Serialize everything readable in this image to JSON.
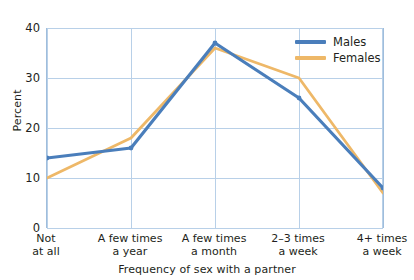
{
  "chart_data": {
    "type": "line",
    "title": "",
    "xlabel": "Frequency of sex with a partner",
    "ylabel": "Percent",
    "categories": [
      "Not\nat all",
      "A few times\na year",
      "A few times\na month",
      "2–3 times\na week",
      "4+ times\na week"
    ],
    "series": [
      {
        "name": "Males",
        "values": [
          14,
          16,
          37,
          26,
          8
        ],
        "color": "#4a7ebb"
      },
      {
        "name": "Females",
        "values": [
          10,
          18,
          36,
          30,
          7
        ],
        "color": "#eeb868"
      }
    ],
    "ylim": [
      0,
      40
    ],
    "yticks": [
      0,
      10,
      20,
      30,
      40
    ],
    "ytick_labels": [
      "0",
      "10",
      "20",
      "30",
      "40"
    ],
    "grid": "horizontal-and-vertical",
    "legend_position": "top-right-inside"
  },
  "axes": {
    "y_label": "Percent",
    "y_tick_labels": [
      "40",
      "30",
      "20",
      "10",
      "0"
    ],
    "x_tick_labels": [
      {
        "line1": "Not",
        "line2": "at all"
      },
      {
        "line1": "A few times",
        "line2": "a year"
      },
      {
        "line1": "A few times",
        "line2": "a month"
      },
      {
        "line1": "2–3 times",
        "line2": "a week"
      },
      {
        "line1": "4+ times",
        "line2": "a week"
      }
    ],
    "x_axis_title": "Frequency of sex with a partner"
  },
  "legend": {
    "items": [
      {
        "label": "Males",
        "color": "#4a7ebb"
      },
      {
        "label": "Females",
        "color": "#eeb868"
      }
    ]
  },
  "colors": {
    "males_line": "#4a7ebb",
    "females_line": "#eeb868",
    "gridline": "#b8d0e8",
    "axis": "#9fbddc",
    "text": "#231f20",
    "background": "#ffffff"
  },
  "fragment": {
    "top_clipped_text": ""
  }
}
